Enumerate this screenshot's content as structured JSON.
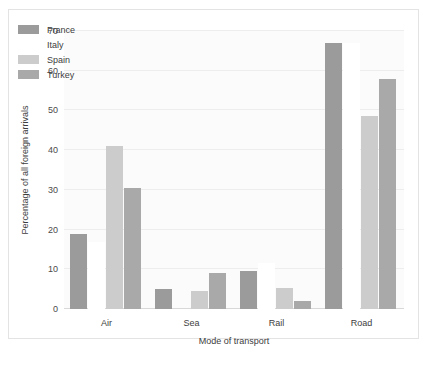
{
  "chart_data": {
    "type": "bar",
    "title": "",
    "xlabel": "Mode of transport",
    "ylabel": "Percentage of all foreign arrivals",
    "categories": [
      "Air",
      "Sea",
      "Rail",
      "Road"
    ],
    "ylim": [
      0,
      70
    ],
    "yticks": [
      0,
      10,
      20,
      30,
      40,
      50,
      60,
      70
    ],
    "grid": true,
    "legend_position": "top-left",
    "series": [
      {
        "name": "France",
        "color": "#9b9b9b",
        "values": [
          19,
          5,
          9.5,
          67
        ]
      },
      {
        "name": "Italy",
        "color": "#ffffff",
        "values": [
          17,
          0,
          11.5,
          67
        ]
      },
      {
        "name": "Spain",
        "color": "#cccccc",
        "values": [
          41,
          4.5,
          5.3,
          48.5
        ]
      },
      {
        "name": "Turkey",
        "color": "#a9a9a9",
        "values": [
          30.5,
          9,
          2,
          58
        ]
      }
    ]
  },
  "caption": {
    "text": ""
  }
}
